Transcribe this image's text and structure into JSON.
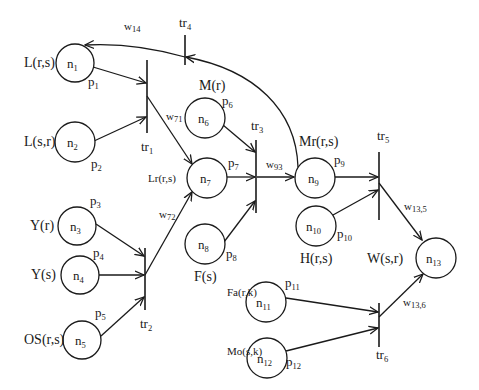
{
  "figure": {
    "type": "petri-net-diagram",
    "colors": {
      "stroke": "#1a1a1a",
      "background": "#ffffff"
    }
  },
  "nodes": [
    {
      "id": "n1",
      "base": "n",
      "sub": "1",
      "label": "L(r,s)",
      "place": "p",
      "place_sub": "1"
    },
    {
      "id": "n2",
      "base": "n",
      "sub": "2",
      "label": "L(s,r)",
      "place": "p",
      "place_sub": "2"
    },
    {
      "id": "n3",
      "base": "n",
      "sub": "3",
      "label": "Y(r)",
      "place": "p",
      "place_sub": "3"
    },
    {
      "id": "n4",
      "base": "n",
      "sub": "4",
      "label": "Y(s)",
      "place": "p",
      "place_sub": "4"
    },
    {
      "id": "n5",
      "base": "n",
      "sub": "5",
      "label": "OS(r,s)",
      "place": "p",
      "place_sub": "5"
    },
    {
      "id": "n6",
      "base": "n",
      "sub": "6",
      "label": "M(r)",
      "place": "p",
      "place_sub": "6"
    },
    {
      "id": "n7",
      "base": "n",
      "sub": "7",
      "label": "Lr(r,s)",
      "place": "p",
      "place_sub": "7"
    },
    {
      "id": "n8",
      "base": "n",
      "sub": "8",
      "label": "F(s)",
      "place": "p",
      "place_sub": "8"
    },
    {
      "id": "n9",
      "base": "n",
      "sub": "9",
      "label": "Mr(r,s)",
      "place": "p",
      "place_sub": "9"
    },
    {
      "id": "n10",
      "base": "n",
      "sub": "10",
      "label": "H(r,s)",
      "place": "p",
      "place_sub": "10"
    },
    {
      "id": "n11",
      "base": "n",
      "sub": "11",
      "label": "Fa(r,k)",
      "place": "p",
      "place_sub": "11"
    },
    {
      "id": "n12",
      "base": "n",
      "sub": "12",
      "label": "Mo(s,k)",
      "place": "p",
      "place_sub": "12"
    },
    {
      "id": "n13",
      "base": "n",
      "sub": "13",
      "label": "W(s,r)"
    }
  ],
  "transitions": [
    {
      "id": "tr1",
      "base": "tr",
      "sub": "1"
    },
    {
      "id": "tr2",
      "base": "tr",
      "sub": "2"
    },
    {
      "id": "tr3",
      "base": "tr",
      "sub": "3"
    },
    {
      "id": "tr4",
      "base": "tr",
      "sub": "4"
    },
    {
      "id": "tr5",
      "base": "tr",
      "sub": "5"
    },
    {
      "id": "tr6",
      "base": "tr",
      "sub": "6"
    }
  ],
  "weights": [
    {
      "id": "w14",
      "base": "w",
      "sub": "14",
      "from": "tr4",
      "to": "n1"
    },
    {
      "id": "w71",
      "base": "w",
      "sub": "71",
      "from": "tr1",
      "to": "n7"
    },
    {
      "id": "w72",
      "base": "w",
      "sub": "72",
      "from": "tr2",
      "to": "n7"
    },
    {
      "id": "w93",
      "base": "w",
      "sub": "93",
      "from": "tr3",
      "to": "n9"
    },
    {
      "id": "w13_5",
      "base": "w",
      "sub": "13,5",
      "from": "tr5",
      "to": "n13"
    },
    {
      "id": "w13_6",
      "base": "w",
      "sub": "13,6",
      "from": "tr6",
      "to": "n13"
    }
  ],
  "arcs": [
    {
      "from": "n1",
      "to": "tr1"
    },
    {
      "from": "n2",
      "to": "tr1"
    },
    {
      "from": "tr1",
      "to": "n7"
    },
    {
      "from": "n3",
      "to": "tr2"
    },
    {
      "from": "n4",
      "to": "tr2"
    },
    {
      "from": "n5",
      "to": "tr2"
    },
    {
      "from": "tr2",
      "to": "n7"
    },
    {
      "from": "n6",
      "to": "tr3"
    },
    {
      "from": "n7",
      "to": "tr3"
    },
    {
      "from": "n8",
      "to": "tr3"
    },
    {
      "from": "tr3",
      "to": "n9"
    },
    {
      "from": "n9",
      "to": "tr4"
    },
    {
      "from": "tr4",
      "to": "n1"
    },
    {
      "from": "n9",
      "to": "tr5"
    },
    {
      "from": "n10",
      "to": "tr5"
    },
    {
      "from": "tr5",
      "to": "n13"
    },
    {
      "from": "n11",
      "to": "tr6"
    },
    {
      "from": "n12",
      "to": "tr6"
    },
    {
      "from": "tr6",
      "to": "n13"
    }
  ]
}
